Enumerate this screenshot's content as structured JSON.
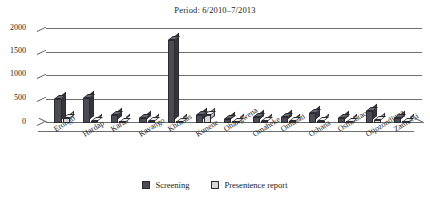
{
  "chart_data": {
    "type": "bar",
    "title": "Period: 6/2010–7/2013",
    "xlabel": "",
    "ylabel": "",
    "ylim": [
      0,
      2000
    ],
    "yticks": [
      0,
      500,
      1000,
      1500,
      2000
    ],
    "grid": true,
    "legend_position": "bottom",
    "categories": [
      "Erongo",
      "Hardap",
      "Karas",
      "Kavango",
      "Khomas",
      "Kunene",
      "Ohangwena",
      "Omaheke",
      "Omusati",
      "Oshana",
      "Oshikotao",
      "Otjozondjupa",
      "Zambesi"
    ],
    "series": [
      {
        "name": "Screening",
        "color": "#4b4b53",
        "values": [
          510,
          540,
          180,
          110,
          1760,
          180,
          95,
          130,
          120,
          210,
          110,
          260,
          110
        ]
      },
      {
        "name": "Presentence report",
        "color": "#d7d7da",
        "values": [
          110,
          35,
          30,
          40,
          30,
          170,
          30,
          35,
          35,
          45,
          30,
          60,
          30
        ]
      }
    ]
  },
  "legend": {
    "items": [
      {
        "label": "Screening"
      },
      {
        "label": "Presentence report"
      }
    ]
  },
  "axis": {
    "y_tick_labels": [
      "2000",
      "1500",
      "1000",
      "500",
      "0"
    ]
  }
}
